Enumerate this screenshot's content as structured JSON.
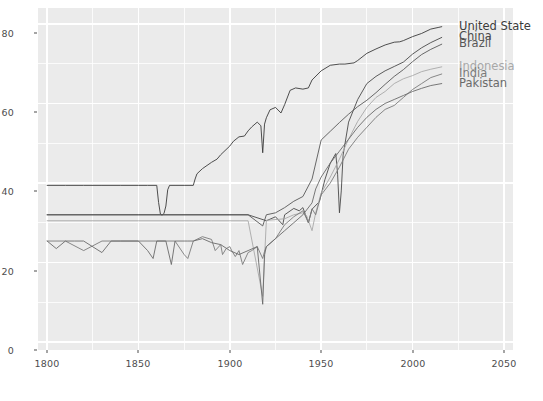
{
  "chart_data": {
    "type": "line",
    "title": "",
    "subtitle": "",
    "xlabel": "",
    "ylabel": "",
    "xlim": [
      1795,
      2055
    ],
    "ylim": [
      -2,
      84
    ],
    "xticks": [
      1800,
      1850,
      1900,
      1950,
      2000,
      2050
    ],
    "yticks": [
      0,
      20,
      40,
      60,
      80
    ],
    "grid": true,
    "grid_color": "#ffffff",
    "panel_color": "#ebebeb",
    "legend_position": "direct-labels-right",
    "series": [
      {
        "name": "United States",
        "color": "#3b3b3b",
        "label_y": 79.3,
        "clipped": true,
        "x": [
          1800,
          1810,
          1820,
          1830,
          1840,
          1850,
          1855,
          1860,
          1861,
          1862,
          1863,
          1864,
          1865,
          1866,
          1867,
          1870,
          1875,
          1880,
          1881,
          1882,
          1885,
          1890,
          1893,
          1895,
          1900,
          1902,
          1905,
          1908,
          1910,
          1912,
          1915,
          1917,
          1918,
          1919,
          1920,
          1922,
          1925,
          1928,
          1930,
          1933,
          1936,
          1940,
          1943,
          1945,
          1950,
          1955,
          1960,
          1963,
          1968,
          1970,
          1975,
          1980,
          1985,
          1990,
          1993,
          1995,
          2000,
          2005,
          2010,
          2014,
          2016
        ],
        "y": [
          39.4,
          39.4,
          39.4,
          39.4,
          39.4,
          39.4,
          39.4,
          39.4,
          35.1,
          32.2,
          31.9,
          32.4,
          34.2,
          38.3,
          39.4,
          39.4,
          39.4,
          39.4,
          41.0,
          42.3,
          43.6,
          45.2,
          46.0,
          47.1,
          49.3,
          50.5,
          51.6,
          51.8,
          53.1,
          54.1,
          55.3,
          54.4,
          47.6,
          54.8,
          56.4,
          58.4,
          59.0,
          57.6,
          59.7,
          63.3,
          63.9,
          63.6,
          63.9,
          65.9,
          68.2,
          69.6,
          69.9,
          69.9,
          70.2,
          70.8,
          72.6,
          73.7,
          74.7,
          75.4,
          75.5,
          75.8,
          76.8,
          77.6,
          78.7,
          79.1,
          79.3
        ]
      },
      {
        "name": "China",
        "color": "#4a4a4a",
        "label_y": 76.6,
        "clipped": false,
        "x": [
          1800,
          1850,
          1900,
          1910,
          1920,
          1925,
          1929,
          1930,
          1935,
          1938,
          1940,
          1943,
          1945,
          1949,
          1952,
          1955,
          1958,
          1959,
          1960,
          1961,
          1962,
          1965,
          1970,
          1975,
          1980,
          1985,
          1990,
          1995,
          2000,
          2005,
          2010,
          2016
        ],
        "y": [
          32.0,
          32.0,
          32.0,
          32.0,
          30.5,
          31.5,
          29.5,
          32.0,
          33.6,
          33.0,
          33.8,
          30.0,
          33.4,
          35.3,
          40.8,
          45.0,
          47.4,
          42.2,
          32.5,
          38.0,
          47.0,
          55.3,
          61.0,
          65.0,
          66.8,
          68.2,
          69.3,
          70.4,
          72.4,
          74.0,
          75.3,
          76.6
        ]
      },
      {
        "name": "Brazil",
        "color": "#585858",
        "label_y": 74.9,
        "clipped": false,
        "x": [
          1800,
          1850,
          1875,
          1900,
          1910,
          1918,
          1920,
          1925,
          1930,
          1935,
          1940,
          1945,
          1950,
          1955,
          1960,
          1965,
          1970,
          1975,
          1980,
          1985,
          1990,
          1995,
          2000,
          2005,
          2010,
          2016
        ],
        "y": [
          32.0,
          32.0,
          32.0,
          32.0,
          32.0,
          29.2,
          32.0,
          32.5,
          33.8,
          35.4,
          36.6,
          41.0,
          50.8,
          53.0,
          55.2,
          57.3,
          59.2,
          60.8,
          62.7,
          64.8,
          66.8,
          68.5,
          70.5,
          72.3,
          73.6,
          74.9
        ]
      },
      {
        "name": "Indonesia",
        "color": "#a8a8a8",
        "label_y": 69.2,
        "clipped": false,
        "x": [
          1800,
          1850,
          1870,
          1880,
          1890,
          1900,
          1910,
          1918,
          1920,
          1930,
          1935,
          1940,
          1942,
          1945,
          1947,
          1950,
          1955,
          1960,
          1965,
          1970,
          1975,
          1980,
          1985,
          1990,
          1995,
          2000,
          2005,
          2010,
          2016
        ],
        "y": [
          30.5,
          30.5,
          30.5,
          30.5,
          30.5,
          30.5,
          30.5,
          11.5,
          30.6,
          31.0,
          32.0,
          32.5,
          31.8,
          28.0,
          32.5,
          37.5,
          41.5,
          46.0,
          51.0,
          55.5,
          59.0,
          61.5,
          63.0,
          65.0,
          66.2,
          67.0,
          68.0,
          68.6,
          69.2
        ]
      },
      {
        "name": "India",
        "color": "#7a7a7a",
        "label_y": 67.4,
        "clipped": false,
        "x": [
          1800,
          1810,
          1820,
          1830,
          1840,
          1850,
          1860,
          1870,
          1875,
          1877,
          1880,
          1885,
          1890,
          1892,
          1895,
          1896,
          1898,
          1900,
          1901,
          1903,
          1905,
          1907,
          1910,
          1912,
          1915,
          1918,
          1919,
          1920,
          1925,
          1930,
          1935,
          1940,
          1943,
          1945,
          1947,
          1950,
          1955,
          1960,
          1965,
          1970,
          1975,
          1980,
          1985,
          1990,
          1995,
          2000,
          2005,
          2010,
          2016
        ],
        "y": [
          25.4,
          25.4,
          23.0,
          25.4,
          25.4,
          25.4,
          25.4,
          25.4,
          22.0,
          21.0,
          25.4,
          26.5,
          25.8,
          23.0,
          24.5,
          22.0,
          23.5,
          24.0,
          23.0,
          21.5,
          23.0,
          19.5,
          22.5,
          23.0,
          24.0,
          21.0,
          22.8,
          24.0,
          26.0,
          29.5,
          31.5,
          33.0,
          30.0,
          33.5,
          32.0,
          37.0,
          40.0,
          44.0,
          48.5,
          51.5,
          54.0,
          56.5,
          58.5,
          59.5,
          61.5,
          63.5,
          65.0,
          66.5,
          67.4
        ]
      },
      {
        "name": "Pakistan",
        "color": "#6a6a6a",
        "label_y": 65.0,
        "clipped": false,
        "x": [
          1800,
          1805,
          1810,
          1815,
          1820,
          1830,
          1835,
          1840,
          1850,
          1855,
          1858,
          1860,
          1865,
          1868,
          1870,
          1875,
          1877,
          1880,
          1885,
          1890,
          1895,
          1900,
          1905,
          1910,
          1915,
          1918,
          1919,
          1920,
          1925,
          1930,
          1935,
          1940,
          1945,
          1947,
          1950,
          1955,
          1960,
          1965,
          1970,
          1975,
          1980,
          1985,
          1990,
          1995,
          2000,
          2005,
          2010,
          2016
        ],
        "y": [
          25.4,
          23.5,
          25.4,
          25.4,
          25.4,
          22.5,
          25.4,
          25.4,
          25.4,
          23.0,
          21.0,
          25.4,
          25.4,
          19.5,
          25.4,
          25.4,
          25.4,
          25.4,
          26.0,
          25.0,
          24.5,
          23.0,
          22.0,
          23.0,
          24.0,
          9.5,
          22.0,
          24.0,
          26.0,
          28.0,
          30.0,
          32.0,
          35.0,
          38.5,
          41.5,
          45.0,
          48.0,
          51.0,
          54.0,
          56.5,
          58.5,
          60.0,
          61.0,
          62.0,
          63.0,
          63.8,
          64.5,
          65.0
        ]
      }
    ]
  },
  "axes": {
    "y_tick_labels": [
      "0",
      "20",
      "40",
      "60",
      "80"
    ],
    "x_tick_labels": [
      "1800",
      "1850",
      "1900",
      "1950",
      "2000",
      "2050"
    ]
  },
  "labels": {
    "united_states": "United State",
    "china": "China",
    "brazil": "Brazil",
    "indonesia": "Indonesia",
    "india": "India",
    "pakistan": "Pakistan"
  }
}
